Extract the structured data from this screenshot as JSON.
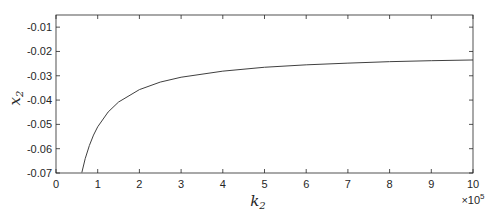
{
  "chart_data": {
    "type": "line",
    "title": "",
    "xlabel": "k_2",
    "ylabel": "x_2",
    "x_multiplier": "×10^5",
    "xlim": [
      0,
      10
    ],
    "ylim": [
      -0.07,
      -0.005
    ],
    "xticks": [
      0,
      1,
      2,
      3,
      4,
      5,
      6,
      7,
      8,
      9,
      10
    ],
    "xtick_labels": [
      "0",
      "1",
      "2",
      "3",
      "4",
      "5",
      "6",
      "7",
      "8",
      "9",
      "10"
    ],
    "yticks": [
      -0.07,
      -0.06,
      -0.05,
      -0.04,
      -0.03,
      -0.02,
      -0.01
    ],
    "ytick_labels": [
      "-0.07",
      "-0.06",
      "-0.05",
      "-0.04",
      "-0.03",
      "-0.02",
      "-0.01"
    ],
    "grid": false,
    "legend": null,
    "series": [
      {
        "name": "x2 vs k2",
        "color": "#404040",
        "x": [
          0.62,
          0.7,
          0.8,
          0.9,
          1.0,
          1.25,
          1.5,
          2.0,
          2.5,
          3.0,
          4.0,
          5.0,
          6.0,
          7.0,
          8.0,
          9.0,
          10.0
        ],
        "y": [
          -0.0698,
          -0.0641,
          -0.0587,
          -0.0544,
          -0.051,
          -0.0449,
          -0.0408,
          -0.0357,
          -0.0326,
          -0.0306,
          -0.0281,
          -0.0265,
          -0.0255,
          -0.0248,
          -0.0242,
          -0.0238,
          -0.0235
        ]
      }
    ]
  }
}
